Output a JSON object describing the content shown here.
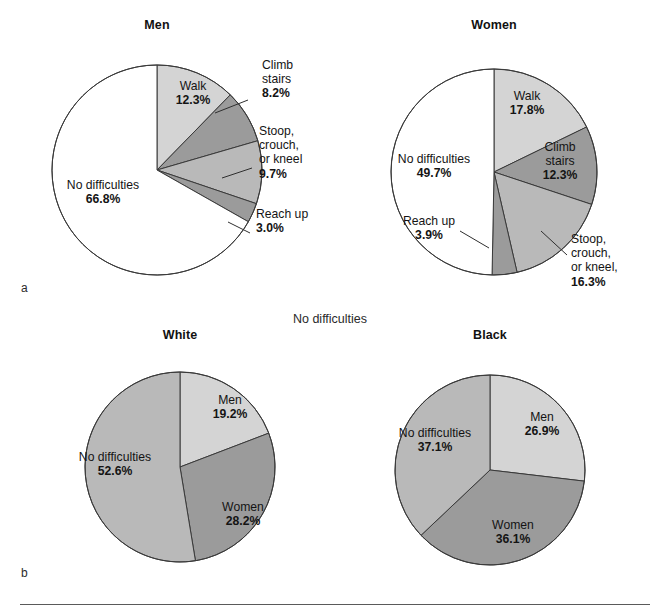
{
  "figure": {
    "panel_a_letter": "a",
    "panel_b_letter": "b",
    "center_note": "No difficulties",
    "colors": {
      "slice_light": "#d4d4d4",
      "slice_mid": "#b9b9b9",
      "slice_dark": "#9b9b9b",
      "slice_none": "#ffffff",
      "outline": "#3a3a3a",
      "text": "#141414",
      "rule": "#5a5a5a"
    }
  },
  "chart_data": [
    {
      "type": "pie",
      "id": "men",
      "title": "Men",
      "panel": "a",
      "start_angle_deg": 0,
      "direction": "clockwise",
      "categories": [
        "Walk",
        "Climb stairs",
        "Stoop, crouch, or kneel",
        "Reach up",
        "No difficulties"
      ],
      "values": [
        12.3,
        8.2,
        9.7,
        3.0,
        66.8
      ],
      "labels": [
        {
          "name": "Walk",
          "pct": "12.3%",
          "lines": [
            "Walk"
          ],
          "placement": "inside"
        },
        {
          "name": "Climb stairs",
          "pct": "8.2%",
          "lines": [
            "Climb",
            "stairs"
          ],
          "placement": "outside-right"
        },
        {
          "name": "Stoop, crouch, or kneel",
          "pct": "9.7%",
          "lines": [
            "Stoop,",
            "crouch,",
            "or kneel"
          ],
          "placement": "outside-right"
        },
        {
          "name": "Reach up",
          "pct": "3.0%",
          "lines": [
            "Reach up"
          ],
          "placement": "outside-right"
        },
        {
          "name": "No difficulties",
          "pct": "66.8%",
          "lines": [
            "No difficulties"
          ],
          "placement": "inside"
        }
      ]
    },
    {
      "type": "pie",
      "id": "women",
      "title": "Women",
      "panel": "a",
      "start_angle_deg": 0,
      "direction": "clockwise",
      "categories": [
        "Walk",
        "Climb stairs",
        "Stoop, crouch, or kneel",
        "Reach up",
        "No difficulties"
      ],
      "values": [
        17.8,
        12.3,
        16.3,
        3.9,
        49.7
      ],
      "labels": [
        {
          "name": "Walk",
          "pct": "17.8%",
          "lines": [
            "Walk"
          ],
          "placement": "inside"
        },
        {
          "name": "Climb stairs",
          "pct": "12.3%",
          "lines": [
            "Climb",
            "stairs"
          ],
          "placement": "inside"
        },
        {
          "name": "Stoop, crouch, or kneel",
          "pct": "16.3%",
          "lines": [
            "Stoop,",
            "crouch,",
            "or kneel,"
          ],
          "placement": "outside-right"
        },
        {
          "name": "Reach up",
          "pct": "3.9%",
          "lines": [
            "Reach up"
          ],
          "placement": "outside-left"
        },
        {
          "name": "No difficulties",
          "pct": "49.7%",
          "lines": [
            "No difficulties"
          ],
          "placement": "inside"
        }
      ]
    },
    {
      "type": "pie",
      "id": "white",
      "title": "White",
      "panel": "b",
      "start_angle_deg": 0,
      "direction": "clockwise",
      "categories": [
        "Men",
        "Women",
        "No difficulties"
      ],
      "values": [
        19.2,
        28.2,
        52.6
      ],
      "labels": [
        {
          "name": "Men",
          "pct": "19.2%",
          "lines": [
            "Men"
          ],
          "placement": "inside"
        },
        {
          "name": "Women",
          "pct": "28.2%",
          "lines": [
            "Women"
          ],
          "placement": "inside"
        },
        {
          "name": "No difficulties",
          "pct": "52.6%",
          "lines": [
            "No difficulties"
          ],
          "placement": "inside"
        }
      ]
    },
    {
      "type": "pie",
      "id": "black",
      "title": "Black",
      "panel": "b",
      "start_angle_deg": 0,
      "direction": "clockwise",
      "categories": [
        "Men",
        "Women",
        "No difficulties"
      ],
      "values": [
        26.9,
        36.1,
        37.1
      ],
      "labels": [
        {
          "name": "Men",
          "pct": "26.9%",
          "lines": [
            "Men"
          ],
          "placement": "inside"
        },
        {
          "name": "Women",
          "pct": "36.1%",
          "lines": [
            "Women"
          ],
          "placement": "inside"
        },
        {
          "name": "No difficulties",
          "pct": "37.1%",
          "lines": [
            "No difficulties"
          ],
          "placement": "inside"
        }
      ]
    }
  ],
  "geometry": {
    "men": {
      "cx": 157,
      "cy": 170,
      "r": 105,
      "title_x": 157,
      "title_y": 18
    },
    "women": {
      "cx": 494,
      "cy": 172,
      "r": 103,
      "title_x": 494,
      "title_y": 18
    },
    "white": {
      "cx": 180,
      "cy": 467,
      "r": 95,
      "title_x": 180,
      "title_y": 328
    },
    "black": {
      "cx": 490,
      "cy": 470,
      "r": 95,
      "title_x": 490,
      "title_y": 328
    }
  }
}
